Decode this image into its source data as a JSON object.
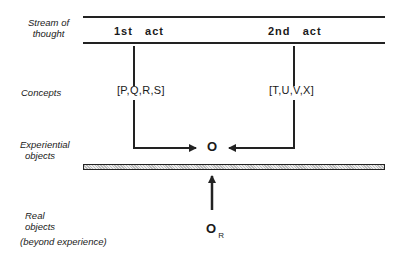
{
  "diagram": {
    "row_labels": {
      "stream": [
        "Stream of",
        "thought"
      ],
      "concepts": "Concepts",
      "experiential": [
        "Experiential",
        "objects"
      ],
      "real": [
        "Real",
        "objects"
      ],
      "real_note": "(beyond experience)"
    },
    "acts": [
      {
        "label": "1st   act"
      },
      {
        "label": "2nd   act"
      }
    ],
    "concept_sets": [
      {
        "label": "[P,Q,R,S]"
      },
      {
        "label": "[T,U,V,X]"
      }
    ],
    "experiential_object": "O",
    "real_object": {
      "symbol": "O",
      "subscript": "R"
    },
    "colors": {
      "line": "#222222",
      "bar_fill": "#cccccc",
      "background": "#ffffff"
    }
  }
}
